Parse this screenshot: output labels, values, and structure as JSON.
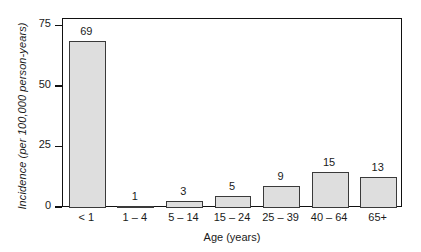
{
  "chart_data": {
    "type": "bar",
    "title": "",
    "xlabel": "Age (years)",
    "ylabel": "Incidence (per 100,000 person-years)",
    "categories": [
      "< 1",
      "1 – 4",
      "5 – 14",
      "15 – 24",
      "25 – 39",
      "40 – 64",
      "65+"
    ],
    "values": [
      69,
      1,
      3,
      5,
      9,
      15,
      13
    ],
    "value_labels": [
      "69",
      "1",
      "3",
      "5",
      "9",
      "15",
      "13"
    ],
    "ylim": [
      0,
      78
    ],
    "yticks": [
      0,
      25,
      50,
      75
    ],
    "ytick_labels": [
      "0",
      "25",
      "50",
      "75"
    ],
    "grid": false,
    "legend": null,
    "bar_fill_color": "#dedede",
    "bar_edge_color": "#3a3a3a",
    "axis_color": "#111111",
    "background_color": "#ffffff"
  }
}
